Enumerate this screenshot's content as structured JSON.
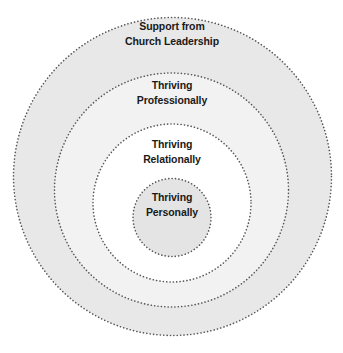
{
  "diagram": {
    "type": "nested-circles",
    "rings": [
      {
        "id": "outer",
        "lines": [
          "Support from",
          "Church Leadership"
        ],
        "fill": "#e8e8e8",
        "cx": 172.5,
        "cy": 176.5,
        "r": 159
      },
      {
        "id": "professional",
        "lines": [
          "Thriving",
          "Professionally"
        ],
        "fill": "#f2f2f2",
        "cx": 171.5,
        "cy": 190,
        "r": 117
      },
      {
        "id": "relational",
        "lines": [
          "Thriving",
          "Relationally"
        ],
        "fill": "#ffffff",
        "cx": 172,
        "cy": 203,
        "r": 79
      },
      {
        "id": "personal",
        "lines": [
          "Thriving",
          "Personally"
        ],
        "fill": "#e4e4e4",
        "cx": 172,
        "cy": 217.5,
        "r": 39
      }
    ],
    "stroke_color": "#555555"
  }
}
